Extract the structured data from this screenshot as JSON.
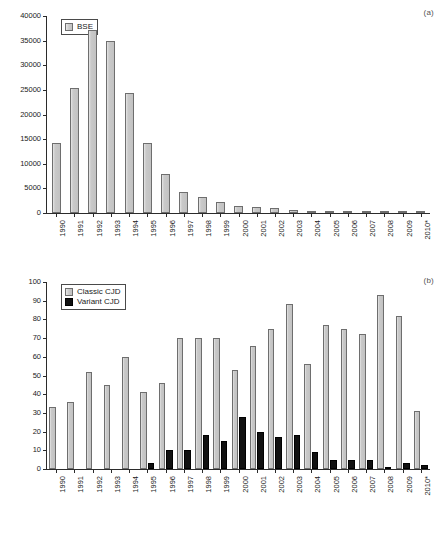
{
  "figure": {
    "panels": [
      {
        "id": "a",
        "label": "(a)",
        "legend_position": "top-left"
      },
      {
        "id": "b",
        "label": "(b)",
        "legend_position": "top-left"
      }
    ]
  },
  "chart_data": [
    {
      "type": "bar",
      "panel": "(a)",
      "title": "",
      "xlabel": "",
      "ylabel": "",
      "grid": false,
      "legend": [
        "BSE"
      ],
      "legend_position": "top-left",
      "ylim": [
        0,
        40000
      ],
      "yticks": [
        0,
        5000,
        10000,
        15000,
        20000,
        25000,
        30000,
        35000,
        40000
      ],
      "ytick_labels": [
        "0",
        "5000",
        "10000",
        "15000",
        "20000",
        "25000",
        "30000",
        "35000",
        "40000"
      ],
      "categories": [
        "1990",
        "1991",
        "1992",
        "1993",
        "1994",
        "1995",
        "1996",
        "1997",
        "1998",
        "1999",
        "2000",
        "2001",
        "2002",
        "2003",
        "2004",
        "2005",
        "2006",
        "2007",
        "2008",
        "2009",
        "2010*"
      ],
      "series": [
        {
          "name": "BSE",
          "color": "#c9c9c9",
          "values": [
            14300,
            25300,
            37200,
            35000,
            24400,
            14300,
            8000,
            4300,
            3200,
            2250,
            1440,
            1200,
            1040,
            610,
            340,
            230,
            120,
            60,
            38,
            18,
            8
          ]
        }
      ]
    },
    {
      "type": "bar",
      "panel": "(b)",
      "title": "",
      "xlabel": "",
      "ylabel": "",
      "grid": false,
      "legend": [
        "Classic CJD",
        "Variant CJD"
      ],
      "legend_position": "top-left",
      "ylim": [
        0,
        100
      ],
      "yticks": [
        0,
        10,
        20,
        30,
        40,
        50,
        60,
        70,
        80,
        90,
        100
      ],
      "ytick_labels": [
        "0",
        "10",
        "20",
        "30",
        "40",
        "50",
        "60",
        "70",
        "80",
        "90",
        "100"
      ],
      "categories": [
        "1990",
        "1991",
        "1992",
        "1993",
        "1994",
        "1995",
        "1996",
        "1997",
        "1998",
        "1999",
        "2000",
        "2001",
        "2002",
        "2003",
        "2004",
        "2005",
        "2006",
        "2007",
        "2008",
        "2009",
        "2010*"
      ],
      "series": [
        {
          "name": "Classic CJD",
          "color": "#c9c9c9",
          "values": [
            33,
            36,
            52,
            45,
            60,
            41,
            46,
            70,
            70,
            70,
            53,
            66,
            75,
            88,
            56,
            77,
            75,
            72,
            93,
            82,
            31
          ]
        },
        {
          "name": "Variant CJD",
          "color": "#111111",
          "values": [
            0,
            0,
            0,
            0,
            0,
            3,
            10,
            10,
            18,
            15,
            28,
            20,
            17,
            18,
            9,
            5,
            5,
            5,
            1,
            3,
            2
          ]
        }
      ]
    }
  ]
}
